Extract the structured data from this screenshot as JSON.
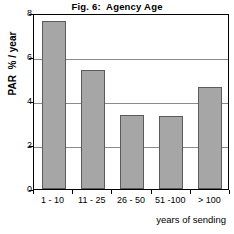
{
  "chart_data": {
    "type": "bar",
    "title": "Fig. 6:  Agency Age",
    "xlabel": "years of sending",
    "ylabel": "PAR  % / year",
    "categories": [
      "1 - 10",
      "11 - 25",
      "26 - 50",
      "51 -100",
      "> 100"
    ],
    "values": [
      7.65,
      5.4,
      3.35,
      3.3,
      4.65
    ],
    "ylim": [
      0,
      8
    ],
    "yticks": [
      0,
      2,
      4,
      6,
      8
    ],
    "ytick_labels": [
      "0",
      "2",
      "4",
      "6",
      "8"
    ],
    "grid": true,
    "legend": false,
    "bar_color": "#a6a6a6",
    "bar_edge_color": "#5b5b5b",
    "axis_color": "#000000",
    "grid_color": "#8a8a8a"
  }
}
